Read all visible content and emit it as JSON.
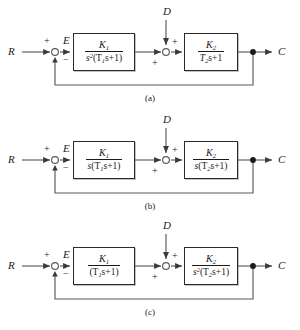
{
  "figure": {
    "type": "control-block-diagram-set",
    "diagram_count": 3,
    "line_color": "#555555",
    "box_border_color": "#2a2a2a",
    "text_color": "#1a1a1a",
    "background": "#ffffff"
  },
  "common": {
    "input_label": "R",
    "error_label": "E",
    "disturbance_label": "D",
    "output_label": "C",
    "sum1_plus": "+",
    "sum1_minus": "−",
    "sum2_plus_top": "+",
    "sum2_plus_bottom": "+",
    "first_numerator": "K",
    "first_numerator_sub": "1",
    "second_numerator": "K",
    "second_numerator_sub": "2"
  },
  "diagrams": [
    {
      "id": "a",
      "caption": "(a)",
      "block1": {
        "numerator": "K",
        "numerator_sub": "1",
        "denominator_plain": "s²(T₁s+1)",
        "den_lead": "s",
        "den_lead_sup": "2",
        "den_rest_open": "(T",
        "den_rest_sub": "1",
        "den_rest_close": "s+1)"
      },
      "block2": {
        "numerator": "K",
        "numerator_sub": "2",
        "denominator_plain": "T₂s+1",
        "den_lead": "T",
        "den_lead_sup": "",
        "den_rest_open": "",
        "den_rest_sub": "2",
        "den_rest_close": "s+1"
      }
    },
    {
      "id": "b",
      "caption": "(b)",
      "block1": {
        "numerator": "K",
        "numerator_sub": "1",
        "denominator_plain": "s(T₁s+1)",
        "den_lead": "s",
        "den_lead_sup": "",
        "den_rest_open": "(T",
        "den_rest_sub": "1",
        "den_rest_close": "s+1)"
      },
      "block2": {
        "numerator": "K",
        "numerator_sub": "2",
        "denominator_plain": "s(T₂s+1)",
        "den_lead": "s",
        "den_lead_sup": "",
        "den_rest_open": "(T",
        "den_rest_sub": "2",
        "den_rest_close": "s+1)"
      }
    },
    {
      "id": "c",
      "caption": "(c)",
      "block1": {
        "numerator": "K",
        "numerator_sub": "1",
        "denominator_plain": "(T₁s+1)",
        "den_lead": "",
        "den_lead_sup": "",
        "den_rest_open": "(T",
        "den_rest_sub": "1",
        "den_rest_close": "s+1)"
      },
      "block2": {
        "numerator": "K",
        "numerator_sub": "2",
        "denominator_plain": "s²(T₂s+1)",
        "den_lead": "s",
        "den_lead_sup": "2",
        "den_rest_open": "(T",
        "den_rest_sub": "2",
        "den_rest_close": "s+1)"
      }
    }
  ]
}
